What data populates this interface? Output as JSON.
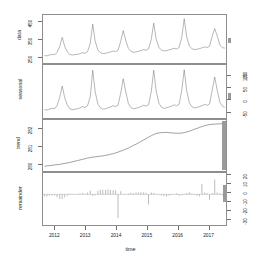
{
  "figure": {
    "kind": "stl-decomposition",
    "xlabel": "time",
    "xticks": [
      "2012",
      "2013",
      "2014",
      "2015",
      "2016",
      "2017"
    ],
    "panels": [
      {
        "id": "data",
        "label": "data",
        "yticks": [
          "250",
          "350",
          "450"
        ],
        "ylim": [
          215,
          470
        ]
      },
      {
        "id": "seasonal",
        "label": "seasonal",
        "yticks": [
          "-50",
          "0",
          "50",
          "100",
          "150"
        ],
        "ylim": [
          -60,
          165
        ]
      },
      {
        "id": "trend",
        "label": "trend",
        "yticks": [
          "280",
          "281",
          "282"
        ],
        "ylim": [
          279.6,
          282.6
        ]
      },
      {
        "id": "remainder",
        "label": "remainder",
        "yticks": [
          "-30",
          "-20",
          "-10",
          "0",
          "10",
          "20"
        ],
        "ylim": [
          -34,
          23
        ]
      }
    ]
  },
  "chart_data": {
    "type": "line",
    "title": "",
    "xlabel": "time",
    "ylabel": "",
    "grid": false,
    "legend": "none",
    "x_axis": {
      "label": "time",
      "ticks": [
        2012,
        2013,
        2014,
        2015,
        2016,
        2017
      ],
      "range": [
        2011.6,
        2017.6
      ]
    },
    "x": [
      2011.65,
      2011.73,
      2011.81,
      2011.9,
      2011.98,
      2012.06,
      2012.15,
      2012.23,
      2012.31,
      2012.4,
      2012.48,
      2012.56,
      2012.65,
      2012.73,
      2012.81,
      2012.9,
      2012.98,
      2013.06,
      2013.15,
      2013.23,
      2013.31,
      2013.4,
      2013.48,
      2013.56,
      2013.65,
      2013.73,
      2013.81,
      2013.9,
      2013.98,
      2014.06,
      2014.15,
      2014.23,
      2014.31,
      2014.4,
      2014.48,
      2014.56,
      2014.65,
      2014.73,
      2014.81,
      2014.9,
      2014.98,
      2015.06,
      2015.15,
      2015.23,
      2015.31,
      2015.4,
      2015.48,
      2015.56,
      2015.65,
      2015.73,
      2015.81,
      2015.9,
      2015.98,
      2016.06,
      2016.15,
      2016.23,
      2016.31,
      2016.4,
      2016.48,
      2016.56,
      2016.65,
      2016.73,
      2016.81,
      2016.9,
      2016.98,
      2017.06,
      2017.15,
      2017.23,
      2017.31,
      2017.4,
      2017.48,
      2017.56
    ],
    "series": [
      {
        "name": "data",
        "panel": "data",
        "type": "line",
        "ylim": [
          215,
          470
        ],
        "yticks": [
          250,
          350,
          450
        ],
        "values": [
          245,
          243,
          248,
          252,
          250,
          262,
          300,
          352,
          300,
          266,
          252,
          248,
          250,
          252,
          256,
          262,
          258,
          268,
          318,
          430,
          330,
          278,
          262,
          256,
          258,
          262,
          266,
          272,
          268,
          276,
          330,
          392,
          336,
          286,
          270,
          264,
          266,
          270,
          274,
          280,
          276,
          284,
          340,
          436,
          344,
          292,
          278,
          272,
          274,
          278,
          282,
          288,
          284,
          292,
          352,
          462,
          356,
          300,
          286,
          280,
          282,
          286,
          290,
          296,
          292,
          300,
          360,
          404,
          362,
          306,
          292,
          288
        ]
      },
      {
        "name": "seasonal",
        "panel": "seasonal",
        "type": "line",
        "ylim": [
          -60,
          165
        ],
        "yticks": [
          -50,
          0,
          50,
          100,
          150
        ],
        "values": [
          -32,
          -34,
          -30,
          -26,
          -28,
          -14,
          26,
          78,
          24,
          -12,
          -28,
          -32,
          -30,
          -28,
          -24,
          -18,
          -22,
          -14,
          28,
          152,
          52,
          -6,
          -24,
          -30,
          -28,
          -24,
          -20,
          -14,
          -18,
          -12,
          46,
          112,
          54,
          -4,
          -22,
          -28,
          -26,
          -22,
          -18,
          -12,
          -16,
          -10,
          52,
          152,
          56,
          -2,
          -20,
          -26,
          -24,
          -20,
          -16,
          -10,
          -14,
          -8,
          58,
          154,
          58,
          0,
          -18,
          -24,
          -22,
          -18,
          -14,
          -8,
          -12,
          -6,
          60,
          120,
          60,
          2,
          -16,
          -22
        ]
      },
      {
        "name": "trend",
        "panel": "trend",
        "type": "line",
        "ylim": [
          279.6,
          282.6
        ],
        "yticks": [
          280,
          281,
          282
        ],
        "values": [
          279.78,
          279.8,
          279.82,
          279.84,
          279.86,
          279.88,
          279.9,
          279.93,
          279.96,
          279.99,
          280.02,
          280.06,
          280.1,
          280.14,
          280.18,
          280.22,
          280.26,
          280.3,
          280.33,
          280.36,
          280.38,
          280.4,
          280.42,
          280.44,
          280.47,
          280.5,
          280.54,
          280.58,
          280.63,
          280.68,
          280.74,
          280.8,
          280.87,
          280.94,
          281.02,
          281.1,
          281.18,
          281.27,
          281.36,
          281.45,
          281.54,
          281.63,
          281.72,
          281.8,
          281.86,
          281.9,
          281.92,
          281.93,
          281.93,
          281.92,
          281.9,
          281.89,
          281.88,
          281.88,
          281.89,
          281.92,
          281.96,
          282.01,
          282.07,
          282.13,
          282.19,
          282.25,
          282.31,
          282.36,
          282.4,
          282.43,
          282.45,
          282.46,
          282.47,
          282.48,
          282.49,
          282.5
        ]
      },
      {
        "name": "remainder",
        "panel": "remainder",
        "type": "bar",
        "ylim": [
          -34,
          23
        ],
        "yticks": [
          -30,
          -20,
          -10,
          0,
          10,
          20
        ],
        "values": [
          -2.4,
          -2.6,
          -1.6,
          -1.4,
          -1.2,
          -3.4,
          -5.6,
          -5.4,
          -3.6,
          -1.6,
          0.8,
          0.6,
          0.4,
          0.6,
          1.2,
          1.4,
          0.6,
          2.2,
          4.4,
          -2.0,
          -1.2,
          4.2,
          5.6,
          5.4,
          5.2,
          5.8,
          5.2,
          5.0,
          4.6,
          -28.0,
          3.8,
          -0.4,
          0.6,
          1.2,
          2.0,
          1.6,
          2.4,
          2.2,
          2.8,
          2.4,
          1.8,
          -12.0,
          2.2,
          1.6,
          0.6,
          -0.6,
          -1.4,
          -2.2,
          -2.6,
          -1.4,
          -0.8,
          0.6,
          1.2,
          -1.6,
          -1.2,
          -0.6,
          1.6,
          2.4,
          1.2,
          -0.8,
          -1.6,
          -2.2,
          12.4,
          2.2,
          1.4,
          -6.4,
          1.6,
          17.6,
          2.2,
          1.4,
          -1.2,
          -2.4
        ]
      }
    ]
  }
}
